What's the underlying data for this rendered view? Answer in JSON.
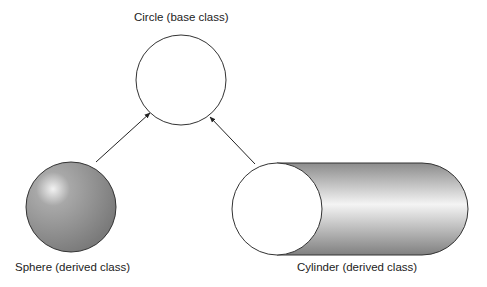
{
  "diagram": {
    "base": {
      "label": "Circle (base class)"
    },
    "derived": [
      {
        "label": "Sphere (derived class)"
      },
      {
        "label": "Cylinder (derived class)"
      }
    ],
    "relations": [
      {
        "from": "Sphere (derived class)",
        "to": "Circle (base class)",
        "type": "inherits"
      },
      {
        "from": "Cylinder (derived class)",
        "to": "Circle (base class)",
        "type": "inherits"
      }
    ]
  }
}
